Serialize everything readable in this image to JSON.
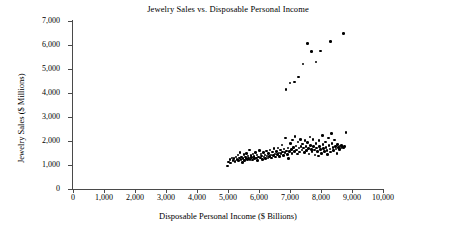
{
  "chart_data": {
    "type": "scatter",
    "title": "Jewelry Sales vs. Disposable Personal Income",
    "xlabel": "Disposable Personal Income ($ Billions)",
    "ylabel": "Jewelry Sales ($ Millions)",
    "xlim": [
      0,
      10000
    ],
    "ylim": [
      0,
      7000
    ],
    "xticks": [
      0,
      1000,
      2000,
      3000,
      4000,
      5000,
      6000,
      7000,
      8000,
      9000,
      10000
    ],
    "yticks": [
      0,
      1000,
      2000,
      3000,
      4000,
      5000,
      6000,
      7000
    ],
    "xtick_labels": [
      "0",
      "1,000",
      "2,000",
      "3,000",
      "4,000",
      "5,000",
      "6,000",
      "7,000",
      "8,000",
      "9,000",
      "10,000"
    ],
    "ytick_labels": [
      "0",
      "1,000",
      "2,000",
      "3,000",
      "4,000",
      "5,000",
      "6,000",
      "7,000"
    ],
    "grid": false,
    "legend": null,
    "marker": "filled-circle",
    "marker_color": "#000000",
    "series": [
      {
        "name": "upper-series",
        "points": [
          [
            6870,
            4150
          ],
          [
            7000,
            4420
          ],
          [
            7140,
            4450
          ],
          [
            7270,
            4660
          ],
          [
            7420,
            5210
          ],
          [
            7560,
            6060
          ],
          [
            7700,
            5720
          ],
          [
            7840,
            5290
          ],
          [
            7980,
            5750
          ],
          [
            8300,
            6150
          ],
          [
            8720,
            6480
          ]
        ]
      },
      {
        "name": "lower-series",
        "points": [
          [
            4990,
            960
          ],
          [
            5010,
            1120
          ],
          [
            5060,
            1230
          ],
          [
            5090,
            1080
          ],
          [
            5130,
            1300
          ],
          [
            5160,
            1190
          ],
          [
            5200,
            1260
          ],
          [
            5230,
            1150
          ],
          [
            5260,
            1330
          ],
          [
            5290,
            1240
          ],
          [
            5320,
            1410
          ],
          [
            5340,
            1180
          ],
          [
            5370,
            1290
          ],
          [
            5390,
            1520
          ],
          [
            5420,
            1230
          ],
          [
            5440,
            1340
          ],
          [
            5460,
            1100
          ],
          [
            5490,
            1270
          ],
          [
            5510,
            1430
          ],
          [
            5530,
            1190
          ],
          [
            5560,
            1340
          ],
          [
            5580,
            1260
          ],
          [
            5600,
            1490
          ],
          [
            5620,
            1220
          ],
          [
            5650,
            1370
          ],
          [
            5670,
            1300
          ],
          [
            5690,
            1620
          ],
          [
            5710,
            1240
          ],
          [
            5740,
            1400
          ],
          [
            5760,
            1320
          ],
          [
            5790,
            1210
          ],
          [
            5810,
            1460
          ],
          [
            5840,
            1350
          ],
          [
            5860,
            1270
          ],
          [
            5890,
            1530
          ],
          [
            5910,
            1300
          ],
          [
            5940,
            1420
          ],
          [
            5960,
            1180
          ],
          [
            5990,
            1340
          ],
          [
            6010,
            1600
          ],
          [
            6040,
            1290
          ],
          [
            6060,
            1450
          ],
          [
            6090,
            1370
          ],
          [
            6110,
            1240
          ],
          [
            6140,
            1520
          ],
          [
            6160,
            1330
          ],
          [
            6190,
            1420
          ],
          [
            6210,
            1260
          ],
          [
            6240,
            1580
          ],
          [
            6260,
            1380
          ],
          [
            6290,
            1300
          ],
          [
            6310,
            1470
          ],
          [
            6340,
            1350
          ],
          [
            6360,
            1620
          ],
          [
            6390,
            1420
          ],
          [
            6410,
            1290
          ],
          [
            6440,
            1540
          ],
          [
            6460,
            1390
          ],
          [
            6490,
            1680
          ],
          [
            6510,
            1450
          ],
          [
            6540,
            1330
          ],
          [
            6560,
            1570
          ],
          [
            6590,
            1430
          ],
          [
            6610,
            1710
          ],
          [
            6640,
            1500
          ],
          [
            6660,
            1360
          ],
          [
            6690,
            1620
          ],
          [
            6710,
            1480
          ],
          [
            6740,
            1840
          ],
          [
            6760,
            1550
          ],
          [
            6790,
            1400
          ],
          [
            6810,
            1660
          ],
          [
            6840,
            1520
          ],
          [
            6860,
            2120
          ],
          [
            6890,
            1580
          ],
          [
            6910,
            1440
          ],
          [
            6940,
            1700
          ],
          [
            6960,
            1260
          ],
          [
            6990,
            1560
          ],
          [
            7010,
            1890
          ],
          [
            7040,
            1640
          ],
          [
            7060,
            1480
          ],
          [
            7090,
            2040
          ],
          [
            7110,
            1720
          ],
          [
            7140,
            1570
          ],
          [
            7160,
            2190
          ],
          [
            7190,
            1800
          ],
          [
            7210,
            1620
          ],
          [
            7240,
            1460
          ],
          [
            7260,
            1950
          ],
          [
            7290,
            1700
          ],
          [
            7310,
            1540
          ],
          [
            7340,
            2060
          ],
          [
            7360,
            1780
          ],
          [
            7390,
            1630
          ],
          [
            7410,
            1880
          ],
          [
            7440,
            1710
          ],
          [
            7460,
            1510
          ],
          [
            7490,
            2010
          ],
          [
            7510,
            1760
          ],
          [
            7540,
            1600
          ],
          [
            7560,
            1930
          ],
          [
            7590,
            1690
          ],
          [
            7610,
            1450
          ],
          [
            7640,
            2160
          ],
          [
            7660,
            1820
          ],
          [
            7690,
            1650
          ],
          [
            7710,
            1560
          ],
          [
            7740,
            2070
          ],
          [
            7760,
            1780
          ],
          [
            7790,
            1620
          ],
          [
            7810,
            1420
          ],
          [
            7840,
            1900
          ],
          [
            7860,
            1700
          ],
          [
            7890,
            1570
          ],
          [
            7910,
            1380
          ],
          [
            7940,
            2010
          ],
          [
            7960,
            1760
          ],
          [
            7990,
            1640
          ],
          [
            8010,
            1490
          ],
          [
            8040,
            2220
          ],
          [
            8060,
            1850
          ],
          [
            8090,
            1690
          ],
          [
            8110,
            1560
          ],
          [
            8140,
            1960
          ],
          [
            8160,
            1740
          ],
          [
            8190,
            1610
          ],
          [
            8210,
            1430
          ],
          [
            8240,
            2120
          ],
          [
            8260,
            1820
          ],
          [
            8290,
            1660
          ],
          [
            8310,
            1540
          ],
          [
            8340,
            2310
          ],
          [
            8360,
            1890
          ],
          [
            8390,
            1730
          ],
          [
            8410,
            1600
          ],
          [
            8440,
            2040
          ],
          [
            8460,
            1780
          ],
          [
            8490,
            1660
          ],
          [
            8510,
            1490
          ],
          [
            8540,
            1860
          ],
          [
            8560,
            1720
          ],
          [
            8590,
            1640
          ],
          [
            8610,
            1790
          ],
          [
            8640,
            1700
          ],
          [
            8660,
            1820
          ],
          [
            8690,
            1750
          ],
          [
            8720,
            1700
          ],
          [
            8760,
            1780
          ],
          [
            8800,
            2360
          ]
        ]
      }
    ]
  }
}
